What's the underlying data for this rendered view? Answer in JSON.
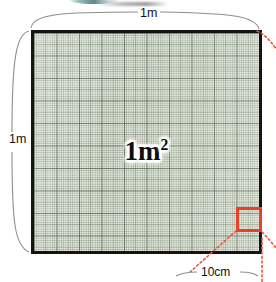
{
  "diagram": {
    "area_label": "1m",
    "area_label_exponent": "2",
    "dimensions": {
      "top": "1m",
      "left": "1m",
      "callout": "10cm"
    },
    "colors": {
      "grid_fill": "#e3e8dd",
      "grid_line": "#6e7e66",
      "square_border": "#141414",
      "callout_red": "#e8402a",
      "bracket_gray": "#8a8a8a",
      "accent_teal": "#3e7c7a"
    },
    "grid": {
      "small_cells_per_side": 100,
      "major_cells_per_side": 10
    },
    "callout": {
      "shape": "square",
      "side_label": "10cm",
      "position": "bottom-right"
    }
  }
}
